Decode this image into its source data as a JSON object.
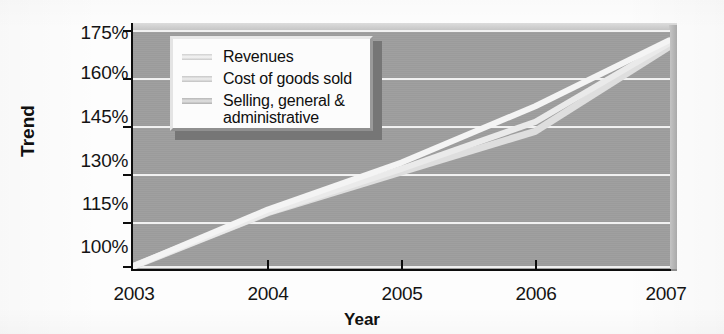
{
  "chart_data": {
    "type": "line",
    "title": "",
    "xlabel": "Year",
    "ylabel": "Trend",
    "x": [
      2003,
      2004,
      2005,
      2006,
      2007
    ],
    "xtick_labels": [
      "2003",
      "2004",
      "2005",
      "2006",
      "2007"
    ],
    "ytick_labels": [
      "175%",
      "160%",
      "145%",
      "130%",
      "115%",
      "100%"
    ],
    "ytick_values": [
      175,
      160,
      145,
      130,
      115,
      100
    ],
    "ylim": [
      100,
      175
    ],
    "xlim": [
      2003,
      2007
    ],
    "grid": "horizontal",
    "legend_position": "upper-left-inside",
    "series": [
      {
        "name": "Revenues",
        "color": "#f4f4f4",
        "values": [
          100,
          118,
          133,
          151,
          172
        ]
      },
      {
        "name": "Cost of goods sold",
        "color": "#eaeaea",
        "values": [
          100,
          117,
          131,
          146,
          171
        ]
      },
      {
        "name": "Selling, general & administrative",
        "color": "#dedede",
        "values": [
          100,
          117,
          130,
          143,
          170
        ]
      }
    ]
  },
  "axes": {
    "y_title": "Trend",
    "x_title": "Year"
  },
  "legend": {
    "entries": [
      {
        "label": "Revenues"
      },
      {
        "label": "Cost of goods sold"
      },
      {
        "label": "Selling, general &"
      }
    ],
    "continuation_label": "administrative"
  },
  "colors": {
    "plot_background": "#9d9d9d",
    "gridline": "#f1f1f1",
    "axis": "#0d0d0d",
    "legend_background": "#fcfcfc",
    "text": "#141414"
  }
}
